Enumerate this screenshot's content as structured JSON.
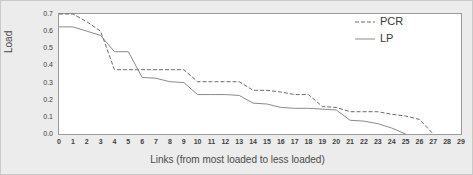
{
  "chart_data": {
    "type": "line",
    "title": "",
    "xlabel": "Links (from most loaded to less loaded)",
    "ylabel": "Load",
    "xlim": [
      0,
      29
    ],
    "ylim": [
      0.0,
      0.7
    ],
    "grid": false,
    "legend_position": "top-right",
    "x": [
      0,
      1,
      2,
      3,
      4,
      5,
      6,
      7,
      8,
      9,
      10,
      11,
      12,
      13,
      14,
      15,
      16,
      17,
      18,
      19,
      20,
      21,
      22,
      23,
      24,
      25,
      26,
      27,
      28,
      29
    ],
    "xticklabels": [
      "0",
      "1",
      "2",
      "3",
      "4",
      "5",
      "6",
      "7",
      "8",
      "9",
      "10",
      "11",
      "12",
      "13",
      "14",
      "15",
      "16",
      "17",
      "18",
      "19",
      "20",
      "21",
      "22",
      "23",
      "24",
      "25",
      "26",
      "27",
      "28",
      "29"
    ],
    "yticklabels": [
      "0.0",
      "0.1",
      "0.2",
      "0.3",
      "0.4",
      "0.5",
      "0.6",
      "0.7"
    ],
    "ytickvalues": [
      0.0,
      0.1,
      0.2,
      0.3,
      0.4,
      0.5,
      0.6,
      0.7
    ],
    "series": [
      {
        "name": "PCR",
        "style": "dashed",
        "color": "#6b6b6b",
        "values": [
          0.7,
          0.7,
          0.655,
          0.6,
          0.375,
          0.375,
          0.375,
          0.375,
          0.375,
          0.375,
          0.305,
          0.305,
          0.305,
          0.305,
          0.255,
          0.255,
          0.245,
          0.23,
          0.23,
          0.16,
          0.155,
          0.13,
          0.13,
          0.13,
          0.115,
          0.105,
          0.085,
          0.0,
          null,
          null
        ]
      },
      {
        "name": "LP",
        "style": "solid",
        "color": "#8a8a8a",
        "values": [
          0.625,
          0.625,
          0.6,
          0.575,
          0.48,
          0.48,
          0.33,
          0.325,
          0.305,
          0.3,
          0.23,
          0.23,
          0.23,
          0.225,
          0.18,
          0.175,
          0.155,
          0.15,
          0.15,
          0.145,
          0.14,
          0.08,
          0.075,
          0.06,
          0.035,
          0.0,
          null,
          null,
          null,
          null
        ]
      }
    ]
  },
  "legend": {
    "entries": [
      {
        "label": "PCR"
      },
      {
        "label": "LP"
      }
    ]
  },
  "axes": {
    "ylabel": "Load",
    "xlabel": "Links (from most loaded to less loaded)"
  }
}
